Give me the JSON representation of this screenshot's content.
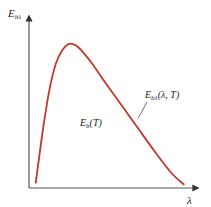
{
  "chart_data": {
    "type": "line",
    "title": "",
    "xlabel": "λ",
    "ylabel": "E_bλ",
    "ylabel_main": "E",
    "ylabel_sub": "bλ",
    "xlabel_text": "λ",
    "curve_label_main": "E",
    "curve_label_sub": "bλ",
    "curve_label_rest": "(λ, T)",
    "area_label_main": "E",
    "area_label_sub": "b",
    "area_label_rest": "(T)",
    "curve_color": "#c0392b",
    "axis_color": "#555555",
    "grid": false,
    "xlim": [
      0,
      1
    ],
    "ylim": [
      0,
      1
    ],
    "series": [
      {
        "name": "E_bλ(λ, T)",
        "x": [
          0.04,
          0.08,
          0.12,
          0.16,
          0.2,
          0.24,
          0.28,
          0.32,
          0.38,
          0.45,
          0.55,
          0.65,
          0.75,
          0.85,
          0.93
        ],
        "y": [
          0.03,
          0.35,
          0.62,
          0.8,
          0.89,
          0.93,
          0.92,
          0.88,
          0.8,
          0.69,
          0.54,
          0.39,
          0.24,
          0.1,
          0.02
        ]
      }
    ]
  }
}
